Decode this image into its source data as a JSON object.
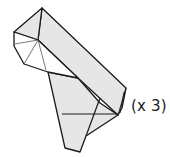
{
  "diagram": {
    "type": "origami-fold-step",
    "label": "(x 3)",
    "colors": {
      "paper_fill": "#e6e6e6",
      "paper_light": "#f4f4f4",
      "outline": "#1a1a1a",
      "crease": "#555555"
    }
  }
}
